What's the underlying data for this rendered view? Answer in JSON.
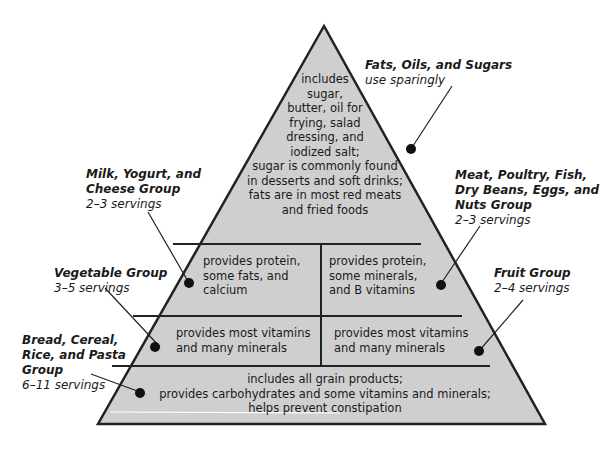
{
  "diagram": {
    "fill_color": "#cfcfcf",
    "line_color": "#222222",
    "tiers": [
      {
        "id": "top",
        "text": [
          "includes",
          "sugar,",
          "butter, oil for",
          "frying, salad",
          "dressing, and",
          "iodized salt;",
          "sugar is commonly found",
          "in desserts and soft drinks;",
          "fats are in most red meats",
          "and fried foods"
        ]
      },
      {
        "id": "milk",
        "text": [
          "provides protein,",
          "some fats, and",
          "calcium"
        ]
      },
      {
        "id": "meat",
        "text": [
          "provides protein,",
          "some minerals,",
          "and B vitamins"
        ]
      },
      {
        "id": "vegetable",
        "text": [
          "provides most vitamins",
          "and many minerals"
        ]
      },
      {
        "id": "fruit",
        "text": [
          "provides most vitamins",
          "and many minerals"
        ]
      },
      {
        "id": "grain",
        "text": [
          "includes all grain products;",
          "provides carbohydrates and some vitamins and minerals;",
          "helps prevent constipation"
        ]
      }
    ],
    "labels": {
      "fats": {
        "name": "Fats, Oils, and Sugars",
        "servings": "use sparingly"
      },
      "milk": {
        "name": "Milk, Yogurt, and Cheese Group",
        "name_lines": [
          "Milk, Yogurt, and",
          "Cheese Group"
        ],
        "servings": "2–3 servings"
      },
      "meat": {
        "name": "Meat, Poultry, Fish, Dry Beans, Eggs, and Nuts Group",
        "name_lines": [
          "Meat, Poultry, Fish,",
          "Dry Beans, Eggs, and",
          "Nuts Group"
        ],
        "servings": "2–3 servings"
      },
      "vegetable": {
        "name": "Vegetable Group",
        "servings": "3–5 servings"
      },
      "fruit": {
        "name": "Fruit Group",
        "servings": "2–4 servings"
      },
      "grain": {
        "name": "Bread, Cereal, Rice, and Pasta Group",
        "name_lines": [
          "Bread, Cereal,",
          "Rice, and Pasta",
          "Group"
        ],
        "servings": "6–11 servings"
      }
    }
  }
}
